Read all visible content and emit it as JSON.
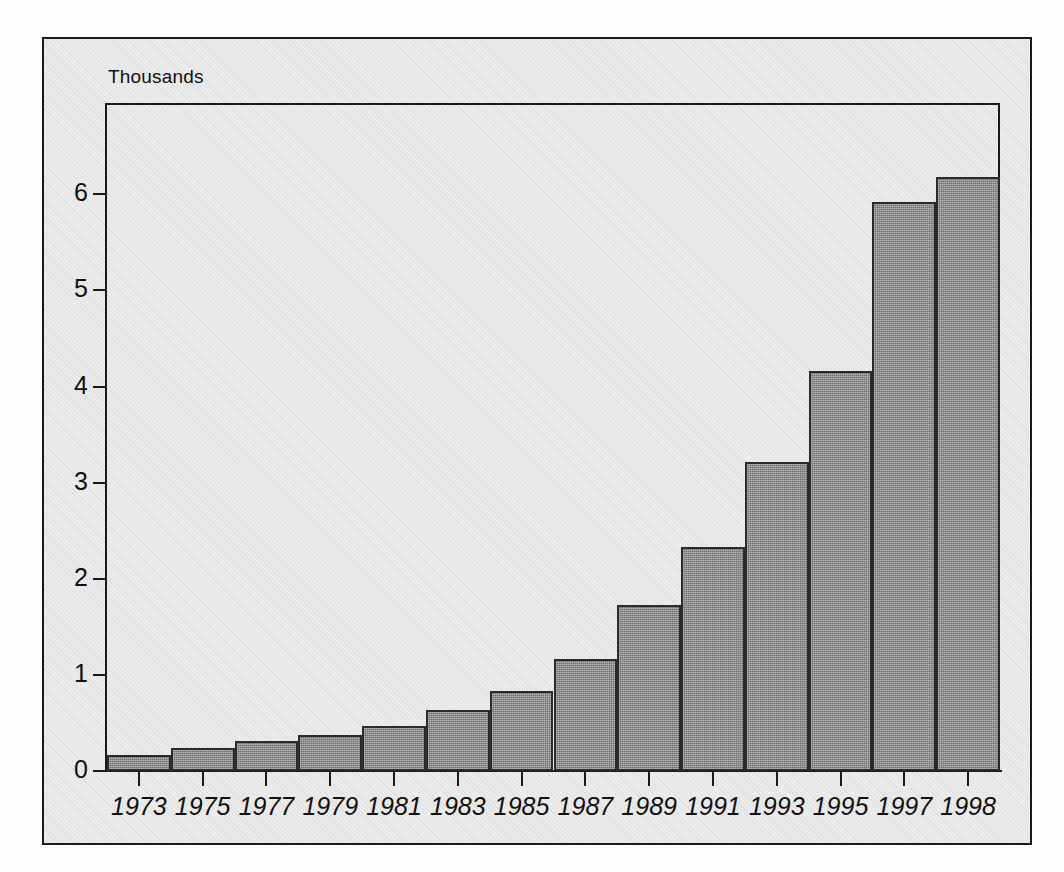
{
  "chart_data": {
    "type": "bar",
    "title": "",
    "subtitle": "",
    "units_label": "Thousands",
    "xlabel": "",
    "ylabel": "",
    "categories": [
      "1973",
      "1975",
      "1977",
      "1979",
      "1981",
      "1983",
      "1985",
      "1987",
      "1989",
      "1991",
      "1993",
      "1995",
      "1997",
      "1998"
    ],
    "values": [
      0.17,
      0.24,
      0.31,
      0.37,
      0.47,
      0.63,
      0.83,
      1.17,
      1.73,
      2.33,
      3.21,
      4.16,
      5.92,
      6.18
    ],
    "ylim": [
      0,
      6.95
    ],
    "yticks": [
      0,
      1,
      2,
      3,
      4,
      5,
      6
    ],
    "ytick_labels": [
      "0",
      "1",
      "2",
      "3",
      "4",
      "5",
      "6"
    ],
    "grid": false,
    "legend": "none",
    "bar_color": "#8d8d8d",
    "bar_border_color": "#2b2b2b",
    "axis_color": "#1a1a1a",
    "panel_background": "#ececec",
    "page_background": "#fdfdfd"
  }
}
